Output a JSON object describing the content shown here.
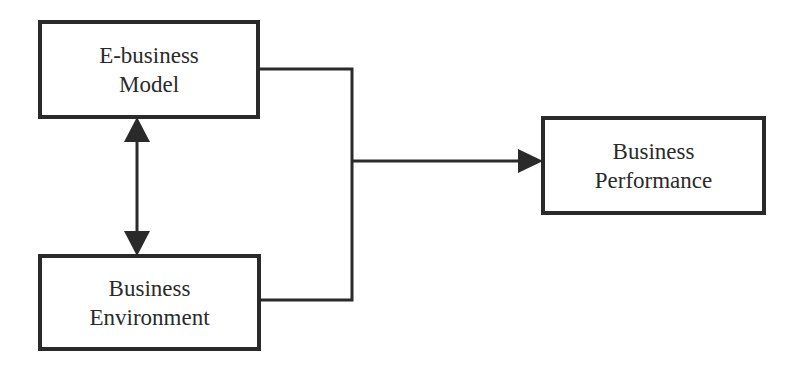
{
  "diagram": {
    "type": "conceptual-model",
    "nodes": [
      {
        "id": "ebusiness-model",
        "lines": [
          "E-business",
          "Model"
        ]
      },
      {
        "id": "business-environment",
        "lines": [
          "Business",
          "Environment"
        ]
      },
      {
        "id": "business-performance",
        "lines": [
          "Business",
          "Performance"
        ]
      }
    ],
    "edges": [
      {
        "from": "ebusiness-model",
        "to": "business-environment",
        "style": "bidirectional-arrow"
      },
      {
        "from": "ebusiness-model",
        "to": "business-performance",
        "style": "merged-connector-arrow"
      },
      {
        "from": "business-environment",
        "to": "business-performance",
        "style": "merged-connector-arrow"
      }
    ],
    "colors": {
      "stroke": "#2a2a2a",
      "background": "#ffffff"
    }
  }
}
